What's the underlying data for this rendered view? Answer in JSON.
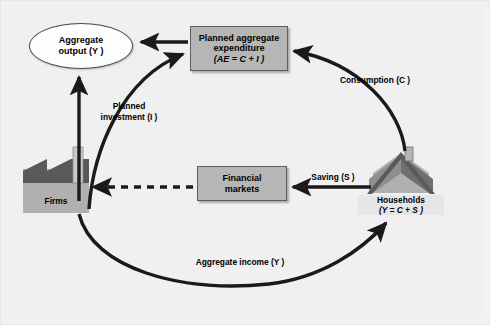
{
  "diagram": {
    "background_color": "#f0f0f0",
    "node_fill_color": "#b6b6b6",
    "node_border_color": "#5e5e5e",
    "arrow_color": "#1a1a1a",
    "nodes": {
      "aggregate_output": {
        "label_line1": "Aggregate",
        "label_line2": "output (Y )",
        "shape": "ellipse"
      },
      "planned_aggregate_expenditure": {
        "label_line1": "Planned aggregate",
        "label_line2": "expenditure",
        "label_line3": "(AE = C + I )",
        "shape": "rectangle"
      },
      "financial_markets": {
        "label_line1": "Financial",
        "label_line2": "markets",
        "shape": "rectangle"
      },
      "firms": {
        "label": "Firms",
        "icon": "factory-icon"
      },
      "households": {
        "label_line1": "Households",
        "label_line2": "(Y = C + S )",
        "icon": "house-icon"
      }
    },
    "edges": {
      "planned_investment": {
        "label_line1": "Planned",
        "label_line2": "investment (I )",
        "style": "solid-curve",
        "from": "firms",
        "to": "planned_aggregate_expenditure"
      },
      "consumption": {
        "label": "Consumption (C )",
        "style": "solid-curve",
        "from": "households",
        "to": "planned_aggregate_expenditure"
      },
      "saving": {
        "label": "Saving (S )",
        "style": "solid-straight",
        "from": "households",
        "to": "financial_markets"
      },
      "aggregate_income": {
        "label": "Aggregate income (Y )",
        "style": "solid-curve",
        "from": "firms",
        "to": "households"
      },
      "financial_to_firms": {
        "label": "",
        "style": "dashed-straight",
        "from": "financial_markets",
        "to": "firms"
      },
      "ae_to_output": {
        "label": "",
        "style": "solid-straight",
        "from": "planned_aggregate_expenditure",
        "to": "aggregate_output"
      },
      "firms_to_output": {
        "label": "",
        "style": "solid-straight",
        "from": "firms",
        "to": "aggregate_output"
      }
    }
  }
}
